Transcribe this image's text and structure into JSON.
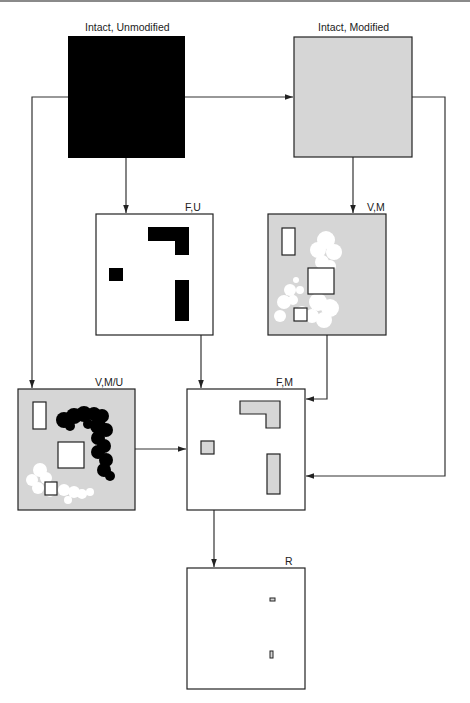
{
  "diagram": {
    "colors": {
      "black": "#000000",
      "gray_fill": "#d6d6d6",
      "white": "#ffffff",
      "line": "#333333"
    },
    "boxes": [
      {
        "id": "intact_unmodified",
        "label": "Intact, Unmodified",
        "fill": "black"
      },
      {
        "id": "intact_modified",
        "label": "Intact, Modified",
        "fill": "gray"
      },
      {
        "id": "f_u",
        "label": "F,U",
        "fill": "white",
        "contents": "black fragments: L-shape, small square, vertical bar"
      },
      {
        "id": "v_m",
        "label": "V,M",
        "fill": "gray",
        "contents": "white blobs with outlined white rectangles"
      },
      {
        "id": "v_m_u",
        "label": "V,M/U",
        "fill": "gray",
        "contents": "black blob, white blobs, outlined white rectangles"
      },
      {
        "id": "f_m",
        "label": "F,M",
        "fill": "white",
        "contents": "gray fragments: L-shape, small square, vertical bar"
      },
      {
        "id": "r",
        "label": "R",
        "fill": "white",
        "contents": "two tiny outlined gray rectangles"
      }
    ],
    "edges": [
      {
        "from": "intact_unmodified",
        "to": "intact_modified"
      },
      {
        "from": "intact_unmodified",
        "to": "f_u"
      },
      {
        "from": "intact_unmodified",
        "to": "v_m_u"
      },
      {
        "from": "intact_modified",
        "to": "v_m"
      },
      {
        "from": "intact_modified",
        "to": "f_m"
      },
      {
        "from": "f_u",
        "to": "f_m"
      },
      {
        "from": "v_m",
        "to": "f_m"
      },
      {
        "from": "v_m_u",
        "to": "f_m"
      },
      {
        "from": "f_m",
        "to": "r"
      }
    ]
  }
}
